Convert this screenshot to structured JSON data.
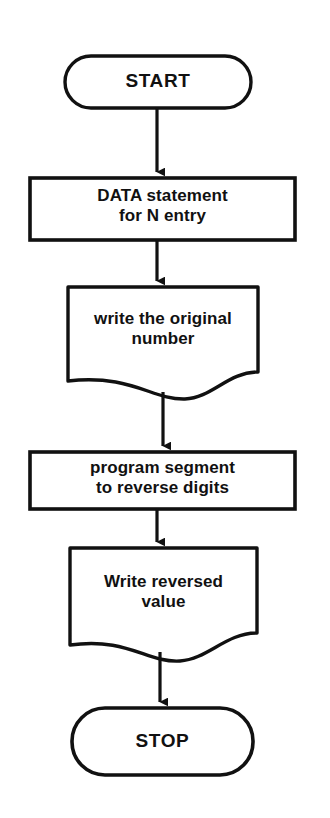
{
  "diagram": {
    "background_color": "#ffffff",
    "stroke_color": "#111111",
    "fill_color": "#ffffff",
    "nodes": [
      {
        "id": "start",
        "shape": "terminal",
        "label": "START",
        "x": 65,
        "y": 56,
        "w": 186,
        "h": 52
      },
      {
        "id": "data-statement",
        "shape": "process",
        "label": "DATA statement\nfor N entry",
        "x": 30,
        "y": 178,
        "w": 265,
        "h": 62
      },
      {
        "id": "write-original",
        "shape": "document",
        "label": "write the original\nnumber",
        "x": 68,
        "y": 287,
        "w": 190,
        "h": 112
      },
      {
        "id": "reverse-digits",
        "shape": "process",
        "label": "program segment\nto reverse digits",
        "x": 30,
        "y": 452,
        "w": 265,
        "h": 57
      },
      {
        "id": "write-reversed",
        "shape": "document",
        "label": "Write reversed\nvalue",
        "x": 70,
        "y": 548,
        "w": 187,
        "h": 113
      },
      {
        "id": "stop",
        "shape": "terminal",
        "label": "STOP",
        "x": 72,
        "y": 708,
        "w": 181,
        "h": 67
      }
    ],
    "connectors": [
      {
        "id": "start-to-data",
        "from": "start",
        "to": "data-statement",
        "x": 157,
        "y1": 108,
        "y2": 178
      },
      {
        "id": "data-to-write-original",
        "from": "data-statement",
        "to": "write-original",
        "x": 157,
        "y1": 240,
        "y2": 287
      },
      {
        "id": "write-original-to-reverse",
        "from": "write-original",
        "to": "reverse-digits",
        "x": 163,
        "y1": 398,
        "y2": 452
      },
      {
        "id": "reverse-to-write-reversed",
        "from": "reverse-digits",
        "to": "write-reversed",
        "x": 157,
        "y1": 509,
        "y2": 548
      },
      {
        "id": "write-reversed-to-stop",
        "from": "write-reversed",
        "to": "stop",
        "x": 160,
        "y1": 655,
        "y2": 708
      }
    ]
  }
}
